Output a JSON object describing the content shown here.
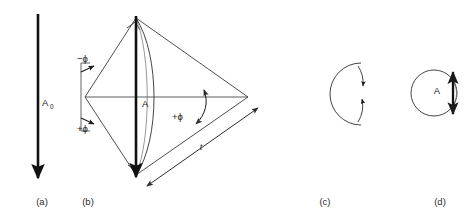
{
  "figure": {
    "type": "vector-evolution-diagram",
    "background_color": "#ffffff",
    "stroke_color": "#1a1a1a",
    "thin_stroke_color": "#3a3a3a",
    "panel_count": 4
  },
  "panels": [
    {
      "id": "a",
      "caption": "(a)",
      "caption_x": 42,
      "caption_y": 205,
      "description": "downward vector arrow",
      "labels": [
        {
          "name": "amplitude-initial",
          "base": "A",
          "sub": "0",
          "x": 38,
          "y": 103
        }
      ]
    },
    {
      "id": "b",
      "caption": "(b)",
      "caption_x": 88,
      "caption_y": 205,
      "description": "fan construction with plus and minus phi angles and arc length t",
      "labels": [
        {
          "name": "angle-minus-phi",
          "text": "−ϕ",
          "x": 77,
          "y": 62
        },
        {
          "name": "angle-plus-phi-left",
          "text": "+ϕ",
          "x": 77,
          "y": 130
        },
        {
          "name": "angle-plus-phi-right",
          "text": "+ϕ",
          "x": 176,
          "y": 117
        },
        {
          "name": "amplitude",
          "text": "A",
          "x": 143,
          "y": 104
        },
        {
          "name": "length-t",
          "text": "t",
          "x": 201,
          "y": 148
        }
      ]
    },
    {
      "id": "c",
      "caption": "(c)",
      "caption_x": 325,
      "caption_y": 205,
      "description": "circle with two converging arrowheads on right side",
      "labels": []
    },
    {
      "id": "d",
      "caption": "(d)",
      "caption_x": 440,
      "caption_y": 205,
      "description": "circle with vertical double-headed vector A on right side",
      "labels": [
        {
          "name": "amplitude",
          "text": "A",
          "x": 438,
          "y": 91
        }
      ]
    }
  ]
}
